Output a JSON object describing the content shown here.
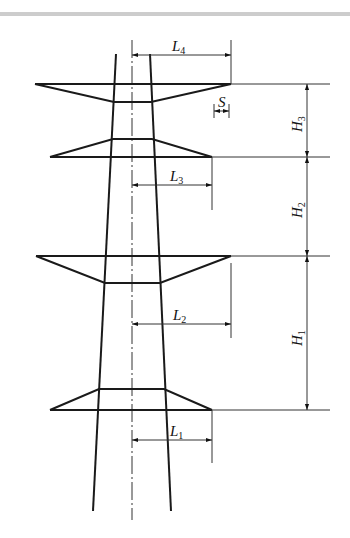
{
  "diagram": {
    "type": "transmission-tower-crossarm-dimensions",
    "colors": {
      "line": "#1a1a1a",
      "thin": "#333333",
      "rule": "#8a8a8a"
    },
    "labels": {
      "L4": {
        "base": "L",
        "sub": "4"
      },
      "L3": {
        "base": "L",
        "sub": "3"
      },
      "L2": {
        "base": "L",
        "sub": "2"
      },
      "L1": {
        "base": "L",
        "sub": "1"
      },
      "H3": {
        "base": "H",
        "sub": "3"
      },
      "H2": {
        "base": "H",
        "sub": "2"
      },
      "H1": {
        "base": "H",
        "sub": "1"
      },
      "S": {
        "base": "S",
        "sub": ""
      }
    },
    "crossarms": [
      {
        "name": "crossarm-4-top",
        "level_y": 84
      },
      {
        "name": "crossarm-3",
        "level_y": 157
      },
      {
        "name": "crossarm-2",
        "level_y": 256
      },
      {
        "name": "crossarm-1-bottom",
        "level_y": 410
      }
    ]
  }
}
